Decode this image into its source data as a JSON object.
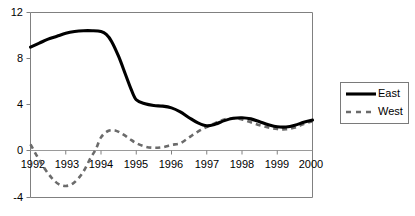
{
  "chart_data": {
    "type": "line",
    "title": "",
    "subtitle": "",
    "xlabel": "",
    "ylabel": "",
    "xlim": [
      1992,
      2000
    ],
    "ylim": [
      -4,
      12
    ],
    "grid": false,
    "legend_position": "right",
    "x": [
      1992,
      1993,
      1994,
      1995,
      1996,
      1997,
      1998,
      1999,
      2000
    ],
    "xticklabels": [
      "1992",
      "1993",
      "1994",
      "1995",
      "1996",
      "1997",
      "1998",
      "1999",
      "2000"
    ],
    "yticks": [
      -4,
      0,
      4,
      8,
      12
    ],
    "yticklabels": [
      "-4",
      "0",
      "4",
      "8",
      "12"
    ],
    "series": [
      {
        "name": "East",
        "style": "solid",
        "color": "#000000",
        "values": [
          9.0,
          10.2,
          10.4,
          4.4,
          3.8,
          2.2,
          2.9,
          2.1,
          2.7
        ],
        "dense_x": [
          1992.0,
          1992.25,
          1992.5,
          1992.75,
          1993.0,
          1993.25,
          1993.5,
          1993.75,
          1994.0,
          1994.15,
          1994.3,
          1994.5,
          1994.7,
          1994.85,
          1995.0,
          1995.25,
          1995.5,
          1995.75,
          1996.0,
          1996.25,
          1996.5,
          1996.75,
          1997.0,
          1997.25,
          1997.5,
          1997.75,
          1998.0,
          1998.25,
          1998.5,
          1998.75,
          1999.0,
          1999.25,
          1999.5,
          1999.75,
          2000.0
        ],
        "dense_y": [
          9.0,
          9.35,
          9.7,
          9.95,
          10.2,
          10.35,
          10.42,
          10.42,
          10.35,
          10.1,
          9.5,
          8.2,
          6.6,
          5.4,
          4.45,
          4.1,
          3.95,
          3.9,
          3.75,
          3.4,
          2.9,
          2.45,
          2.2,
          2.35,
          2.65,
          2.85,
          2.9,
          2.8,
          2.55,
          2.3,
          2.12,
          2.1,
          2.25,
          2.5,
          2.7
        ]
      },
      {
        "name": "West",
        "style": "dashed",
        "color": "#6b6b6b",
        "values": [
          0.6,
          -2.6,
          1.8,
          0.35,
          0.6,
          2.1,
          2.8,
          1.9,
          2.6
        ],
        "dense_x": [
          1992.0,
          1992.2,
          1992.4,
          1992.6,
          1992.8,
          1993.0,
          1993.2,
          1993.4,
          1993.55,
          1993.7,
          1993.85,
          1994.0,
          1994.2,
          1994.4,
          1994.6,
          1994.8,
          1995.0,
          1995.25,
          1995.5,
          1995.75,
          1996.0,
          1996.25,
          1996.5,
          1996.75,
          1997.0,
          1997.25,
          1997.5,
          1997.75,
          1998.0,
          1998.25,
          1998.5,
          1998.75,
          1999.0,
          1999.25,
          1999.5,
          1999.75,
          2000.0
        ],
        "dense_y": [
          0.6,
          -0.5,
          -1.5,
          -2.3,
          -2.85,
          -3.0,
          -2.8,
          -2.2,
          -1.5,
          -0.6,
          0.15,
          1.2,
          1.75,
          1.8,
          1.5,
          1.1,
          0.7,
          0.4,
          0.3,
          0.35,
          0.55,
          0.7,
          1.2,
          1.7,
          2.1,
          2.45,
          2.75,
          2.85,
          2.75,
          2.5,
          2.25,
          2.05,
          1.92,
          1.9,
          2.05,
          2.35,
          2.6
        ]
      }
    ],
    "legend": [
      {
        "label": "East",
        "style": "solid",
        "color": "#000000"
      },
      {
        "label": "West",
        "style": "dashed",
        "color": "#6b6b6b"
      }
    ]
  },
  "colors": {
    "background": "#ffffff",
    "axis": "#808080",
    "east": "#000000",
    "west": "#6b6b6b"
  }
}
